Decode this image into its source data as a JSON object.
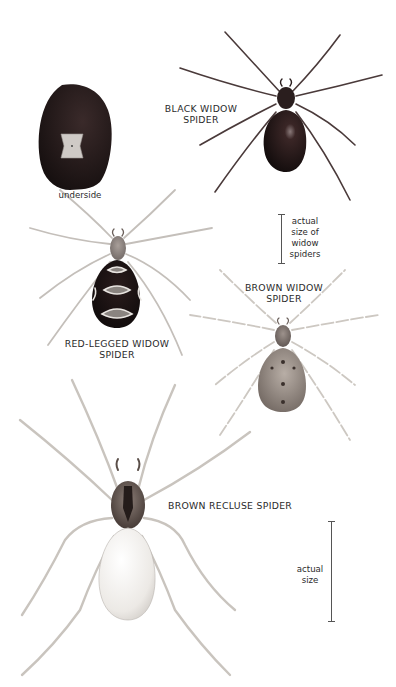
{
  "illustration": {
    "underside": {
      "caption": "underside"
    },
    "black_widow": {
      "name_line1": "BLACK WIDOW",
      "name_line2": "SPIDER"
    },
    "red_legged_widow": {
      "name_line1": "RED-LEGGED WIDOW",
      "name_line2": "SPIDER"
    },
    "brown_widow": {
      "name_line1": "BROWN WIDOW",
      "name_line2": "SPIDER"
    },
    "brown_recluse": {
      "name": "BROWN RECLUSE SPIDER"
    },
    "widow_scale": {
      "line1": "actual",
      "line2": "size of",
      "line3": "widow",
      "line4": "spiders"
    },
    "recluse_scale": {
      "line1": "actual",
      "line2": "size"
    }
  },
  "colors": {
    "background": "#ffffff",
    "black_widow_body": "#1e1414",
    "leg_pale": "#cfcac4",
    "leg_edge": "#8a8580",
    "recluse_abdomen": "#f1efec",
    "brown_widow_abdomen": "#9a8f86",
    "text": "#2b2b2b"
  }
}
